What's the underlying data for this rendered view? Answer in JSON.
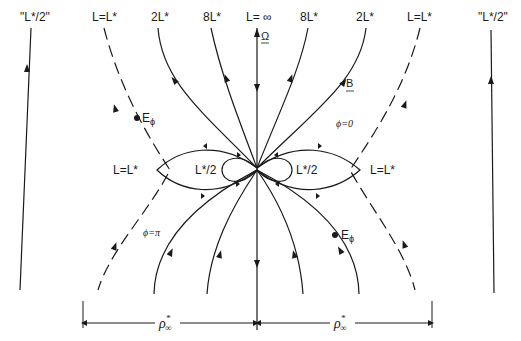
{
  "diagram": {
    "type": "magnetosphere field-line diagram",
    "top_labels": [
      {
        "id": "far-left",
        "text": "\"L*/2\""
      },
      {
        "id": "left-separatrix",
        "text": "L=L*"
      },
      {
        "id": "left-2L",
        "text": "2L*"
      },
      {
        "id": "left-8L",
        "text": "8L*"
      },
      {
        "id": "axis",
        "text": "L= ∞"
      },
      {
        "id": "right-8L",
        "text": "8L*"
      },
      {
        "id": "right-2L",
        "text": "2L*"
      },
      {
        "id": "right-separatrix",
        "text": "L=L*"
      },
      {
        "id": "far-right",
        "text": "\"L*/2\""
      }
    ],
    "axis_vector": "Ω",
    "field_vector": "B",
    "efield_upper_left": "E",
    "efield_lower_right": "E",
    "efield_subscript": "ϕ",
    "phi_zero": "ϕ=0",
    "phi_pi": "ϕ=π",
    "mid_left_separatrix": "L=L*",
    "mid_right_separatrix": "L=L*",
    "inner_left_loop": "L*/2",
    "inner_right_loop": "L*/2",
    "dimension_label_left": "ρ",
    "dimension_label_right": "ρ",
    "dimension_super": "*",
    "dimension_sub": "∞"
  }
}
